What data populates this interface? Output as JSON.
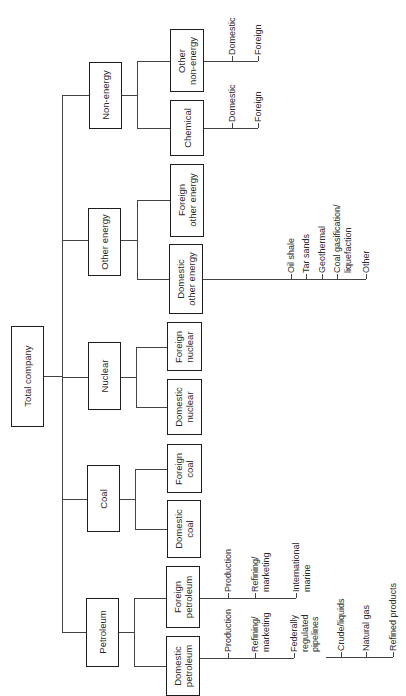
{
  "root": {
    "label": "Total company"
  },
  "divisions": [
    {
      "label": "Non-energy"
    },
    {
      "label": "Other energy"
    },
    {
      "label": "Nuclear"
    },
    {
      "label": "Coal"
    },
    {
      "label": "Petroleum"
    }
  ],
  "units": {
    "other_non_energy": [
      "Other",
      "non-energy"
    ],
    "chemical": [
      "Chemical"
    ],
    "foreign_other_energy": [
      "Foreign",
      "other energy"
    ],
    "domestic_other_energy": [
      "Domestic",
      "other energy"
    ],
    "foreign_nuclear": [
      "Foreign",
      "nuclear"
    ],
    "domestic_nuclear": [
      "Domestic",
      "nuclear"
    ],
    "foreign_coal": [
      "Foreign",
      "coal"
    ],
    "domestic_coal": [
      "Domestic",
      "coal"
    ],
    "foreign_petroleum": [
      "Foreign",
      "petroleum"
    ],
    "domestic_petroleum": [
      "Domestic",
      "petroleum"
    ]
  },
  "leaves": {
    "other_non_energy": [
      "Domestic",
      "Foreign"
    ],
    "chemical": [
      "Domestic",
      "Foreign"
    ],
    "domestic_other_energy": [
      [
        "Oil shale"
      ],
      [
        "Tar sands"
      ],
      [
        "Geothermal"
      ],
      [
        "Coal gasification/",
        "liquefaction"
      ],
      [
        "Other"
      ]
    ],
    "foreign_petroleum": [
      [
        "Production"
      ],
      [
        "Refining/",
        "marketing"
      ],
      [
        "International",
        "marine"
      ]
    ],
    "domestic_petroleum": [
      [
        "Production"
      ],
      [
        "Refining/",
        "marketing"
      ],
      [
        "Federally",
        "regulated",
        "pipelines"
      ]
    ],
    "pipelines": [
      "Crude/liquids",
      "Natural gas",
      "Refined products"
    ]
  }
}
